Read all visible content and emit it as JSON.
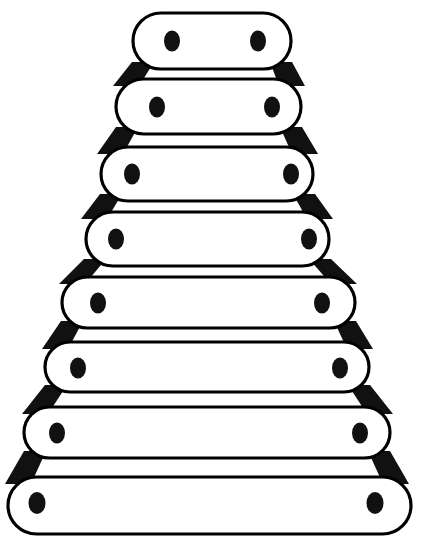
{
  "figure": {
    "title": "Stacked rounded bars forming a tapered tower",
    "canvas": {
      "width": 421,
      "height": 556
    },
    "colors": {
      "background": "#ffffff",
      "outline": "#000000",
      "fill": "#ffffff",
      "connector": "#111111",
      "peg": "#111111"
    },
    "stroke_width": 3.2,
    "rung_count": 8,
    "pegs_per_rung": 2,
    "rungs": [
      {
        "index": 1,
        "x1": 133,
        "x2": 291,
        "top": 13,
        "bottom": 69,
        "peg_left_x": 172,
        "peg_right_x": 258,
        "peg_y": 41,
        "peg_rx": 8.0,
        "peg_ry": 10.5
      },
      {
        "index": 2,
        "x1": 116,
        "x2": 301,
        "top": 79,
        "bottom": 134,
        "peg_left_x": 157,
        "peg_right_x": 272,
        "peg_y": 107,
        "peg_rx": 8.0,
        "peg_ry": 10.5
      },
      {
        "index": 3,
        "x1": 101,
        "x2": 313,
        "top": 147,
        "bottom": 201,
        "peg_left_x": 132,
        "peg_right_x": 291,
        "peg_y": 174,
        "peg_rx": 8.0,
        "peg_ry": 10.5
      },
      {
        "index": 4,
        "x1": 86,
        "x2": 329,
        "top": 212,
        "bottom": 266,
        "peg_left_x": 116,
        "peg_right_x": 309,
        "peg_y": 239,
        "peg_rx": 8.0,
        "peg_ry": 10.5
      },
      {
        "index": 5,
        "x1": 62,
        "x2": 355,
        "top": 277,
        "bottom": 328,
        "peg_left_x": 98,
        "peg_right_x": 322,
        "peg_y": 303,
        "peg_rx": 8.0,
        "peg_ry": 10.5
      },
      {
        "index": 6,
        "x1": 45,
        "x2": 369,
        "top": 342,
        "bottom": 392,
        "peg_left_x": 78,
        "peg_right_x": 340,
        "peg_y": 368,
        "peg_rx": 8.0,
        "peg_ry": 10.5
      },
      {
        "index": 7,
        "x1": 24,
        "x2": 390,
        "top": 407,
        "bottom": 458,
        "peg_left_x": 57,
        "peg_right_x": 360,
        "peg_y": 433,
        "peg_rx": 8.0,
        "peg_ry": 10.5
      },
      {
        "index": 8,
        "x1": 8,
        "x2": 411,
        "top": 477,
        "bottom": 534,
        "peg_left_x": 37,
        "peg_right_x": 375,
        "peg_y": 503,
        "peg_rx": 8.5,
        "peg_ry": 11.0
      }
    ],
    "connectors": [
      {
        "index": 1,
        "side": "left",
        "top_x": 143,
        "bottom_x": 126,
        "top_y": 62,
        "bottom_y": 86,
        "width_top": 22,
        "width_bottom": 26
      },
      {
        "index": 1,
        "side": "right",
        "top_x": 281,
        "bottom_x": 292,
        "top_y": 62,
        "bottom_y": 86,
        "width_top": 22,
        "width_bottom": 26
      },
      {
        "index": 2,
        "side": "left",
        "top_x": 127,
        "bottom_x": 110,
        "top_y": 127,
        "bottom_y": 154,
        "width_top": 22,
        "width_bottom": 26
      },
      {
        "index": 2,
        "side": "right",
        "top_x": 291,
        "bottom_x": 305,
        "top_y": 127,
        "bottom_y": 154,
        "width_top": 22,
        "width_bottom": 26
      },
      {
        "index": 3,
        "side": "left",
        "top_x": 111,
        "bottom_x": 94,
        "top_y": 194,
        "bottom_y": 219,
        "width_top": 22,
        "width_bottom": 26
      },
      {
        "index": 3,
        "side": "right",
        "top_x": 304,
        "bottom_x": 320,
        "top_y": 194,
        "bottom_y": 219,
        "width_top": 22,
        "width_bottom": 26
      },
      {
        "index": 4,
        "side": "left",
        "top_x": 95,
        "bottom_x": 72,
        "top_y": 259,
        "bottom_y": 284,
        "width_top": 22,
        "width_bottom": 26
      },
      {
        "index": 4,
        "side": "right",
        "top_x": 320,
        "bottom_x": 344,
        "top_y": 259,
        "bottom_y": 284,
        "width_top": 22,
        "width_bottom": 26
      },
      {
        "index": 5,
        "side": "left",
        "top_x": 72,
        "bottom_x": 55,
        "top_y": 321,
        "bottom_y": 349,
        "width_top": 22,
        "width_bottom": 26
      },
      {
        "index": 5,
        "side": "right",
        "top_x": 345,
        "bottom_x": 360,
        "top_y": 321,
        "bottom_y": 349,
        "width_top": 22,
        "width_bottom": 26
      },
      {
        "index": 6,
        "side": "left",
        "top_x": 56,
        "bottom_x": 35,
        "top_y": 385,
        "bottom_y": 414,
        "width_top": 22,
        "width_bottom": 26
      },
      {
        "index": 6,
        "side": "right",
        "top_x": 359,
        "bottom_x": 380,
        "top_y": 385,
        "bottom_y": 414,
        "width_top": 22,
        "width_bottom": 26
      },
      {
        "index": 7,
        "side": "left",
        "top_x": 35,
        "bottom_x": 18,
        "top_y": 451,
        "bottom_y": 484,
        "width_top": 22,
        "width_bottom": 26
      },
      {
        "index": 7,
        "side": "right",
        "top_x": 379,
        "bottom_x": 396,
        "top_y": 451,
        "bottom_y": 484,
        "width_top": 22,
        "width_bottom": 26
      }
    ]
  }
}
